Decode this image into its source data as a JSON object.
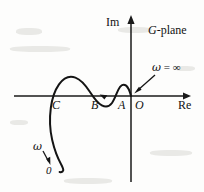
{
  "figure": {
    "name": "nyquist-polar-plot",
    "plane_label_italic": "G",
    "plane_label_rest": "-plane",
    "axes": {
      "imaginary_label": "Im",
      "real_label": "Re",
      "origin_label": "O",
      "real_axis_y": 96,
      "imag_axis_x": 131,
      "real_axis_x_start": 14,
      "real_axis_x_end": 191,
      "imag_axis_y_top": 15,
      "imag_axis_y_bottom": 182
    },
    "points": [
      {
        "key": "C",
        "label": "C",
        "x": 55,
        "y": 96
      },
      {
        "key": "B",
        "label": "B",
        "x": 94,
        "y": 96
      },
      {
        "key": "A",
        "label": "A",
        "x": 121,
        "y": 96
      },
      {
        "key": "O",
        "label": "O",
        "x": 131,
        "y": 96
      }
    ],
    "annotations": [
      {
        "key": "omega-infinity",
        "omega": "ω",
        "equals": " = ",
        "value": "∞",
        "text": "ω = ∞",
        "arrow_from": [
          154,
          76
        ],
        "arrow_to": [
          134,
          92
        ]
      },
      {
        "key": "omega-to-zero",
        "omega": "ω",
        "value": "0",
        "arrow_from": [
          44,
          152
        ],
        "arrow_to": [
          50,
          164
        ]
      }
    ],
    "direction_marker": {
      "key": "travel-direction-arrowhead",
      "x": 104,
      "y": 97,
      "points_toward": "left"
    },
    "curve": {
      "key": "nyquist-locus",
      "stroke": "#141414",
      "stroke_width": 2.0,
      "description": "Locus starts at origin (omega = infinity), small loop above axis near A, dips below axis between A and B, large hump above axis between B and C, then sweeps down and left below the axis ending at omega approaching 0"
    },
    "colors": {
      "ink": "#141414",
      "background": "#fdfdfc",
      "axis": "#1a1a1a"
    }
  }
}
